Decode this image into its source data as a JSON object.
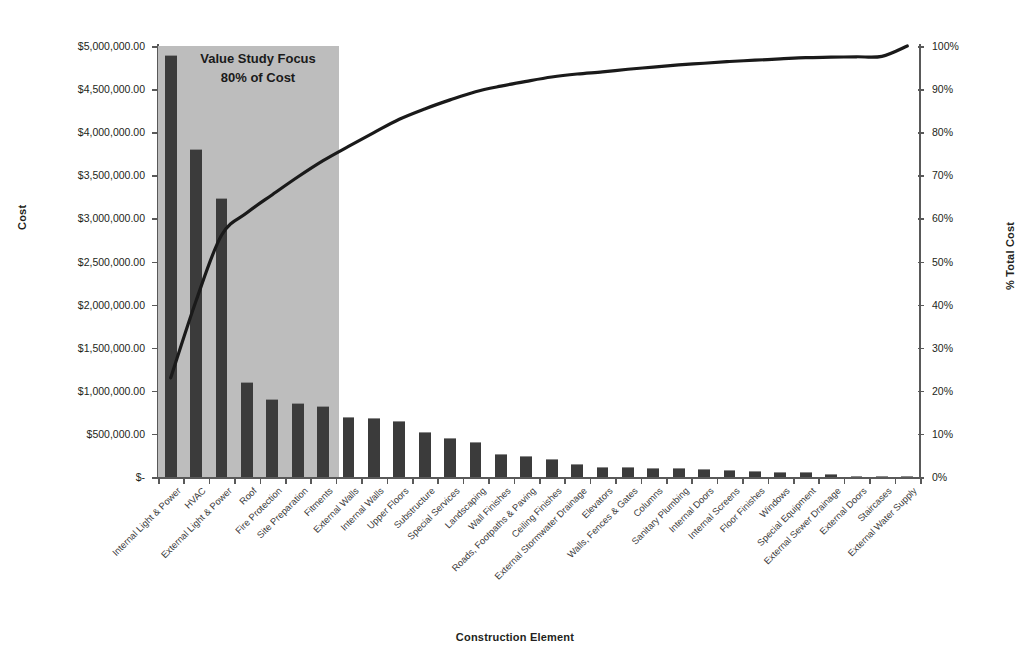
{
  "chart_data": {
    "type": "bar",
    "title": "",
    "xlabel": "Construction Element",
    "ylabel": "Cost",
    "y2label": "% Total Cost",
    "ylim": [
      0,
      5000000
    ],
    "y2lim": [
      0,
      100
    ],
    "grid": false,
    "legend": "none",
    "annotation": {
      "line1": "Value Study Focus",
      "line2": "80% of Cost",
      "covers_categories": 7
    },
    "colors": {
      "bar": "#3b3b3b",
      "line": "#1a1a1a",
      "shade_band": "#bdbdbd",
      "axis": "#595959",
      "text": "#231f20"
    },
    "ytick_labels": [
      "$-",
      "$500,000.00",
      "$1,000,000.00",
      "$1,500,000.00",
      "$2,000,000.00",
      "$2,500,000.00",
      "$3,000,000.00",
      "$3,500,000.00",
      "$4,000,000.00",
      "$4,500,000.00",
      "$5,000,000.00"
    ],
    "ytick_values": [
      0,
      500000,
      1000000,
      1500000,
      2000000,
      2500000,
      3000000,
      3500000,
      4000000,
      4500000,
      5000000
    ],
    "y2tick_labels": [
      "0%",
      "10%",
      "20%",
      "30%",
      "40%",
      "50%",
      "60%",
      "70%",
      "80%",
      "90%",
      "100%"
    ],
    "y2tick_values": [
      0,
      10,
      20,
      30,
      40,
      50,
      60,
      70,
      80,
      90,
      100
    ],
    "categories": [
      "Internal Light & Power",
      "HVAC",
      "External Light & Power",
      "Roof",
      "Fire Protection",
      "Site Preparation",
      "Fitments",
      "External Walls",
      "Internal Walls",
      "Upper Floors",
      "Substructure",
      "Special Services",
      "Landscaping",
      "Wall Finishes",
      "Roads, Footpaths & Paving",
      "Ceiling Finishes",
      "External Stormwater Drainage",
      "Elevators",
      "Walls, Fences & Gates",
      "Columns",
      "Sanitary Plumbing",
      "Internal Doors",
      "Internal Screens",
      "Floor Finishes",
      "Windows",
      "Special Equipment",
      "External Sewer Drainage",
      "External Doors",
      "Staircases",
      "External Water Supply"
    ],
    "series": [
      {
        "name": "Cost",
        "type": "bar",
        "axis": "left",
        "values": [
          4900000,
          3810000,
          3240000,
          1100000,
          910000,
          860000,
          820000,
          700000,
          685000,
          650000,
          520000,
          455000,
          405000,
          265000,
          245000,
          205000,
          150000,
          120000,
          115000,
          110000,
          105000,
          95000,
          85000,
          70000,
          60000,
          55000,
          30000,
          15000,
          8000,
          4000
        ]
      },
      {
        "name": "% Total Cost (cumulative)",
        "type": "line",
        "axis": "right",
        "values": [
          23.0,
          40.9,
          56.1,
          61.3,
          65.5,
          69.6,
          73.4,
          76.7,
          79.9,
          83.0,
          85.4,
          87.5,
          89.4,
          90.7,
          91.8,
          92.8,
          93.5,
          94.0,
          94.6,
          95.1,
          95.6,
          96.0,
          96.4,
          96.7,
          97.0,
          97.3,
          97.4,
          97.5,
          97.6,
          100.0
        ]
      }
    ]
  }
}
